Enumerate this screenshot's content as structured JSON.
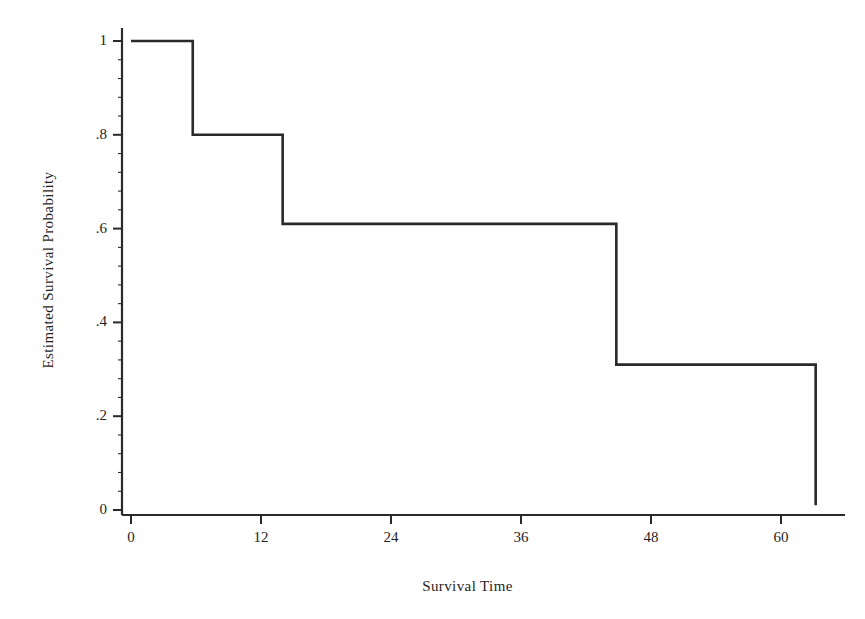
{
  "figure": {
    "background_color": "#ffffff",
    "line_color": "#2a2a2a",
    "axis_color": "#2a2a2a"
  },
  "chart_data": {
    "type": "line",
    "subtype": "kaplan-meier-step",
    "title": "",
    "xlabel": "Survival Time",
    "ylabel": "Estimated Survival Probability",
    "xlim": [
      0,
      65
    ],
    "ylim": [
      0,
      1.05
    ],
    "grid": false,
    "legend": null,
    "xticks": [
      0,
      12,
      24,
      36,
      48,
      60
    ],
    "xtick_labels": [
      "0",
      "12",
      "24",
      "36",
      "48",
      "60"
    ],
    "yticks": [
      0,
      0.2,
      0.4,
      0.6,
      0.8,
      1
    ],
    "ytick_labels": [
      "0",
      ".2",
      ".4",
      ".6",
      ".8",
      "1"
    ],
    "x_minor_tick_count": 0,
    "y_minor_tick_count": 4,
    "series": [
      {
        "name": "Estimated survival probability",
        "step": "post",
        "x": [
          0,
          5.7,
          5.7,
          14.0,
          14.0,
          44.8,
          44.8,
          63.2,
          63.2
        ],
        "y": [
          1.0,
          1.0,
          0.8,
          0.8,
          0.61,
          0.61,
          0.31,
          0.31,
          0.01
        ]
      }
    ],
    "steps": [
      {
        "t_start": 0,
        "t_end": 5.7,
        "probability": 1.0
      },
      {
        "t_start": 5.7,
        "t_end": 14.0,
        "probability": 0.8
      },
      {
        "t_start": 14.0,
        "t_end": 44.8,
        "probability": 0.61
      },
      {
        "t_start": 44.8,
        "t_end": 63.2,
        "probability": 0.31
      },
      {
        "t_start": 63.2,
        "t_end": 63.2,
        "probability": 0.01
      }
    ],
    "annotations": []
  }
}
